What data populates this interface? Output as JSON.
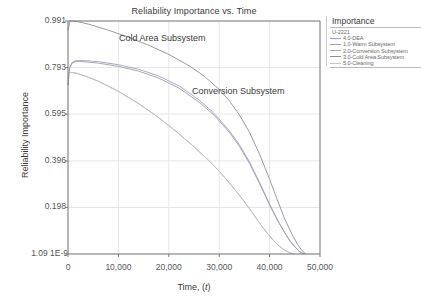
{
  "chart_data": {
    "type": "line",
    "title": "Reliability Importance vs. Time",
    "xlabel": "Time, (t)",
    "ylabel": "Reliability Importance",
    "xlim": [
      0,
      50000
    ],
    "ylim": [
      1.09e-09,
      0.991
    ],
    "grid": true,
    "legend_position": "right",
    "xticks": [
      "0",
      "10,000",
      "20,000",
      "30,000",
      "40,000",
      "50,000"
    ],
    "xtick_values": [
      0,
      10000,
      20000,
      30000,
      40000,
      50000
    ],
    "yticks": [
      "0.991",
      "0.793",
      "0.595",
      "0.396",
      "0.198",
      "1.09 1E-9"
    ],
    "ytick_values": [
      0.991,
      0.793,
      0.595,
      0.396,
      0.198,
      1.09e-09
    ],
    "annotations": [
      {
        "text": "Cold Area Subsystem",
        "x": 13500,
        "y": 0.93
      },
      {
        "text": "Conversion Subsystem",
        "x": 27000,
        "y": 0.72
      }
    ],
    "series": [
      {
        "name": "4.0-DEA",
        "color": "#9aa0c8",
        "x": [
          0,
          300,
          800,
          1500,
          3000,
          6000,
          10000,
          14000,
          18000,
          22000,
          26000,
          29000,
          32000,
          34000,
          36000,
          38000,
          40000,
          41500,
          43000,
          44000,
          45000,
          46000,
          46800
        ],
        "y": [
          0.72,
          0.79,
          0.815,
          0.822,
          0.823,
          0.818,
          0.805,
          0.786,
          0.757,
          0.715,
          0.655,
          0.598,
          0.525,
          0.465,
          0.392,
          0.305,
          0.212,
          0.148,
          0.091,
          0.058,
          0.031,
          0.01,
          1e-09
        ]
      },
      {
        "name": "1.0-Warm Subsystem",
        "color": "#9f9f9f",
        "x": [
          0,
          300,
          800,
          1500,
          3000,
          6000,
          10000,
          14000,
          18000,
          22000,
          26000,
          29000,
          32000,
          34000,
          36000,
          38000,
          40000,
          41500,
          43000,
          44000,
          45000,
          46000,
          46800
        ],
        "y": [
          0.72,
          0.79,
          0.812,
          0.818,
          0.818,
          0.812,
          0.798,
          0.778,
          0.748,
          0.706,
          0.646,
          0.59,
          0.518,
          0.458,
          0.386,
          0.3,
          0.208,
          0.145,
          0.089,
          0.056,
          0.03,
          0.01,
          1e-09
        ]
      },
      {
        "name": "2.0-Conversion Subsystem",
        "color": "#a8a8a8",
        "x": [
          0,
          500,
          1500,
          3000,
          6000,
          10000,
          14000,
          18000,
          22000,
          25000,
          28000,
          30000,
          32000,
          34000,
          36000,
          38000,
          39500,
          41000,
          42000,
          43000,
          44000,
          44800
        ],
        "y": [
          0.762,
          0.772,
          0.77,
          0.76,
          0.735,
          0.692,
          0.64,
          0.58,
          0.512,
          0.456,
          0.396,
          0.352,
          0.303,
          0.25,
          0.193,
          0.132,
          0.089,
          0.052,
          0.032,
          0.016,
          0.005,
          1e-09
        ]
      },
      {
        "name": "3.0-Cold Area Subsystem",
        "color": "#8e8e8e",
        "x": [
          0,
          400,
          1000,
          2000,
          4000,
          8000,
          12000,
          16000,
          20000,
          24000,
          27000,
          30000,
          32000,
          34000,
          36000,
          38000,
          40000,
          41500,
          43000,
          44500,
          45500,
          46500,
          47200
        ],
        "y": [
          0.952,
          0.991,
          0.991,
          0.988,
          0.978,
          0.952,
          0.922,
          0.888,
          0.849,
          0.801,
          0.757,
          0.7,
          0.652,
          0.592,
          0.518,
          0.425,
          0.318,
          0.232,
          0.149,
          0.082,
          0.042,
          0.013,
          1e-09
        ]
      },
      {
        "name": "5.0-Cleaning",
        "color": "#c4c4c4",
        "x": [
          0,
          500,
          1500,
          3000,
          6000,
          10000,
          14000,
          18000,
          22000,
          25000,
          28000,
          30000,
          32000,
          34000,
          36000,
          38000,
          39500,
          41000,
          42000,
          43000,
          44000,
          44800
        ],
        "y": [
          0.762,
          0.772,
          0.77,
          0.76,
          0.735,
          0.692,
          0.64,
          0.58,
          0.512,
          0.456,
          0.396,
          0.352,
          0.303,
          0.25,
          0.193,
          0.132,
          0.089,
          0.052,
          0.032,
          0.016,
          0.005,
          1e-09
        ]
      }
    ]
  },
  "legend": {
    "title": "Importance",
    "group_label": "U-2221",
    "entries": [
      {
        "label": "4.0-DEA",
        "color": "#9aa0c8"
      },
      {
        "label": "1.0-Warm Subsystem",
        "color": "#9f9f9f"
      },
      {
        "label": "2.0-Conversion Subsystem",
        "color": "#a8a8a8"
      },
      {
        "label": "3.0-Cold Area Subsystem",
        "color": "#8e8e8e"
      },
      {
        "label": "5.0-Cleaning",
        "color": "#c4c4c4"
      }
    ]
  },
  "style": {
    "axis_color": "#7a7a7a",
    "grid_color": "#e6e6e6",
    "text_color": "#3a3a3a",
    "background": "#ffffff"
  }
}
